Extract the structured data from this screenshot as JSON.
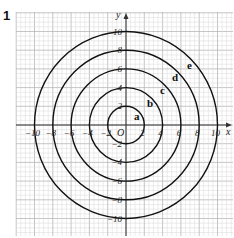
{
  "question_number": "1",
  "axes": {
    "x_label": "x",
    "y_label": "y",
    "origin_label": "O",
    "x_ticks": [
      "−10",
      "−8",
      "−6",
      "−4",
      "−2",
      "2",
      "4",
      "6",
      "8",
      "10"
    ],
    "x_tick_values": [
      -10,
      -8,
      -6,
      -4,
      -2,
      2,
      4,
      6,
      8,
      10
    ],
    "y_ticks": [
      "10",
      "8",
      "6",
      "4",
      "2",
      "−2",
      "−4",
      "−6",
      "−8",
      "−10"
    ],
    "y_tick_values": [
      10,
      8,
      6,
      4,
      2,
      -2,
      -4,
      -6,
      -8,
      -10
    ]
  },
  "circles": [
    {
      "label": "a",
      "radius": 2
    },
    {
      "label": "b",
      "radius": 4
    },
    {
      "label": "c",
      "radius": 6
    },
    {
      "label": "d",
      "radius": 8
    },
    {
      "label": "e",
      "radius": 10
    }
  ],
  "colors": {
    "grid_minor": "#d9d9d9",
    "grid_major": "#b8b8b8",
    "axis": "#333333",
    "circle": "#111111",
    "text": "#222222"
  }
}
